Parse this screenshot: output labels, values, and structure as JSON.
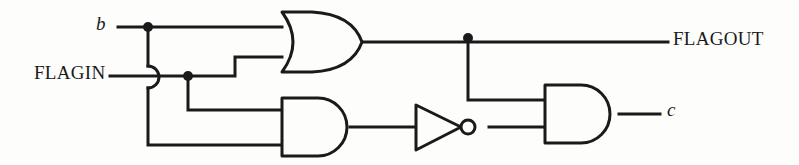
{
  "figure": {
    "kind": "logic-circuit-schematic",
    "width": 799,
    "height": 165,
    "background_color": "#fdfdfc",
    "ink_color": "#1a1a1a",
    "stroke_width": 3
  },
  "labels": {
    "input_b": "b",
    "input_flagin": "FLAGIN",
    "output_flagout": "FLAGOUT",
    "output_c": "c"
  },
  "gates": [
    {
      "id": "or1",
      "type": "or-gate",
      "name": "or-gate",
      "inputs": [
        "b",
        "FLAGIN"
      ],
      "output": "FLAGOUT"
    },
    {
      "id": "and1",
      "type": "and-gate",
      "name": "and-gate-lower-left",
      "inputs": [
        "FLAGIN",
        "b"
      ],
      "output": "and1-out"
    },
    {
      "id": "not1",
      "type": "not-gate",
      "name": "inverter",
      "inputs": [
        "and1-out"
      ],
      "output": "not1-out"
    },
    {
      "id": "and2",
      "type": "and-gate",
      "name": "and-gate-output",
      "inputs": [
        "FLAGOUT",
        "not1-out"
      ],
      "output": "c"
    }
  ],
  "junctions": [
    {
      "name": "junction-b-tap",
      "x": 148,
      "y": 27
    },
    {
      "name": "junction-flagin-tap",
      "x": 188,
      "y": 76
    },
    {
      "name": "junction-flagout-tap",
      "x": 468,
      "y": 38
    }
  ],
  "wire_crossing": {
    "name": "wire-hop-b-over-flagin",
    "x": 148,
    "y": 76,
    "style": "semicircular-hop"
  }
}
